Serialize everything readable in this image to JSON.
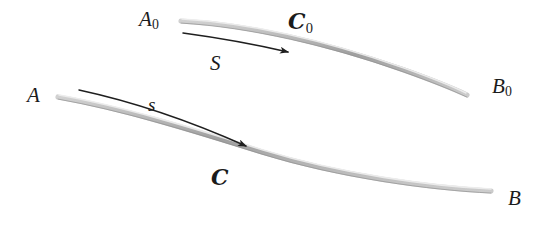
{
  "figure": {
    "kind": "geometry-diagram",
    "background_color": "#ffffff",
    "curve_color": "#a8a8a8",
    "curve_highlight_color": "#d6d6d6",
    "arrow_color": "#1f1f1f",
    "label_color": "#1b1b1b",
    "upper": {
      "start_label": "A",
      "start_subscript": "0",
      "end_label": "B",
      "end_subscript": "0",
      "curve_label": "ℬ",
      "curve_label_text": "C",
      "curve_label_subscript": "0",
      "arc_length_label": "S"
    },
    "lower": {
      "start_label": "A",
      "end_label": "B",
      "curve_label_text": "C",
      "arc_length_label": "s"
    },
    "geometry": {
      "upper_curve_path": "M 181,21 C 250,25 330,44 404,70 C 432,80 452,88 467,95",
      "upper_curve_highlight_path": "M 182,19 C 251,23 330,42 404,68 C 432,78 452,86 466,93",
      "upper_arrow_path": "M 183,33 C 220,38 258,45 288,52",
      "upper_arrow_tip": [
        292,
        53
      ],
      "lower_curve_path": "M 58,97 C 120,108 186,128 262,152 C 340,176 430,188 491,191",
      "lower_curve_highlight_path": "M 59,95 C 121,106 187,126 263,150 C 341,174 431,186 491,189",
      "lower_arrow_path": "M 79,90 C 130,101 190,121 246,146",
      "lower_arrow_tip": [
        251,
        148
      ]
    }
  }
}
